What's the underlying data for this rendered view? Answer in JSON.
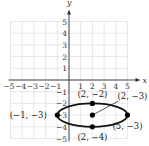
{
  "chart_data": {
    "type": "scatter",
    "title": "",
    "xlabel": "x",
    "ylabel": "y",
    "xlim": [
      -5,
      5
    ],
    "ylim": [
      -5,
      5
    ],
    "grid": true,
    "x_ticks": [
      -5,
      -4,
      -3,
      -2,
      -1,
      1,
      2,
      3,
      4,
      5
    ],
    "y_ticks": [
      -5,
      -4,
      -3,
      -2,
      -1,
      1,
      2,
      3,
      4,
      5
    ],
    "x_tick_labels": [
      "−5",
      "−4",
      "−3",
      "−2",
      "−1",
      "1",
      "2",
      "3",
      "4",
      "5"
    ],
    "y_tick_labels": [
      "−5",
      "−4",
      "−3",
      "−2",
      "−1",
      "1",
      "2",
      "3",
      "4",
      "5"
    ],
    "curves": [
      {
        "type": "ellipse",
        "center": [
          2,
          -3
        ],
        "semi_axis_x": 3,
        "semi_axis_y": 1,
        "equation": "(x-2)^2/9 + (y+3)^2/1 = 1"
      }
    ],
    "points": [
      {
        "x": -1,
        "y": -3,
        "label": "(−1, −3)"
      },
      {
        "x": 5,
        "y": -3,
        "label": "(5, −3)"
      },
      {
        "x": 2,
        "y": -2,
        "label": "(2, −2)"
      },
      {
        "x": 2,
        "y": -4,
        "label": "(2, −4)"
      },
      {
        "x": 2,
        "y": -3,
        "label": "(2, −3)"
      }
    ],
    "annotations": [
      {
        "text": "(2, −3)",
        "points_to": [
          2,
          -3
        ],
        "leader_line": true
      }
    ]
  },
  "colors": {
    "grid": "#d8d8d8",
    "axis": "#333333",
    "curve": "#111111",
    "point": "#000000"
  }
}
